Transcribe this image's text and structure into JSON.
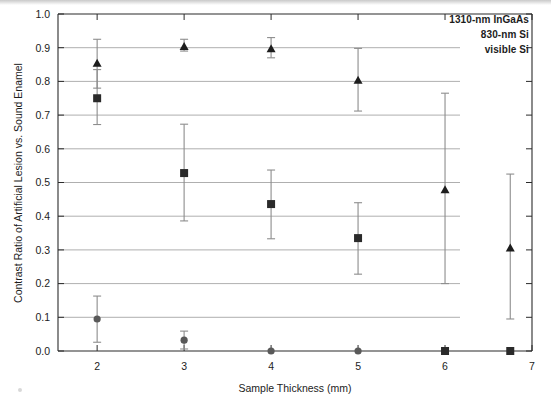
{
  "chart_data": {
    "type": "scatter",
    "title": "",
    "xlabel": "Sample Thickness (mm)",
    "ylabel": "Contrast Ratio of Artificial Lesion vs. Sound Enamel",
    "xlim": [
      1.55,
      7.0
    ],
    "ylim": [
      0.0,
      1.0
    ],
    "xticks": [
      2,
      3,
      4,
      5,
      6,
      7
    ],
    "xtick_labels": [
      "2",
      "3",
      "4",
      "5",
      "6",
      "7"
    ],
    "yticks": [
      0.0,
      0.1,
      0.2,
      0.3,
      0.4,
      0.5,
      0.6,
      0.7,
      0.8,
      0.9,
      1.0
    ],
    "ytick_labels": [
      "0.0",
      "0.1",
      "0.2",
      "0.3",
      "0.4",
      "0.5",
      "0.6",
      "0.7",
      "0.8",
      "0.9",
      "1.0"
    ],
    "grid": true,
    "grid_axis": "y",
    "legend_position": "top-right",
    "series": [
      {
        "name": "1310-nm InGaAs",
        "marker": "triangle",
        "color": "#1d1d1d",
        "x": [
          2.0,
          3.0,
          4.0,
          5.0,
          6.0,
          6.75
        ],
        "y": [
          0.855,
          0.905,
          0.898,
          0.805,
          0.48,
          0.307
        ],
        "yerr_low": [
          0.78,
          0.89,
          0.87,
          0.712,
          0.2,
          0.095
        ],
        "yerr_high": [
          0.925,
          0.925,
          0.93,
          0.898,
          0.765,
          0.525
        ]
      },
      {
        "name": "830-nm Si",
        "marker": "square",
        "color": "#2a2a2a",
        "x": [
          2.0,
          3.0,
          4.0,
          5.0,
          6.0,
          6.75
        ],
        "y": [
          0.75,
          0.528,
          0.436,
          0.335,
          0.0,
          0.0
        ],
        "yerr_low": [
          0.672,
          0.386,
          0.333,
          0.228,
          0.0,
          0.0
        ],
        "yerr_high": [
          0.835,
          0.673,
          0.537,
          0.44,
          0.0,
          0.0
        ]
      },
      {
        "name": "visible Si",
        "marker": "circle",
        "color": "#595959",
        "x": [
          2.0,
          3.0,
          4.0,
          5.0
        ],
        "y": [
          0.095,
          0.032,
          0.0,
          0.0
        ],
        "yerr_low": [
          0.026,
          0.006,
          0.0,
          0.0
        ],
        "yerr_high": [
          0.163,
          0.059,
          0.0,
          0.0
        ]
      }
    ]
  },
  "legend": {
    "line1": "1310-nm InGaAs",
    "line2": "830-nm Si",
    "line3": "visible Si"
  },
  "axes": {
    "x_title": "Sample Thickness (mm)",
    "y_title": "Contrast Ratio of Artificial Lesion vs. Sound Enamel"
  }
}
